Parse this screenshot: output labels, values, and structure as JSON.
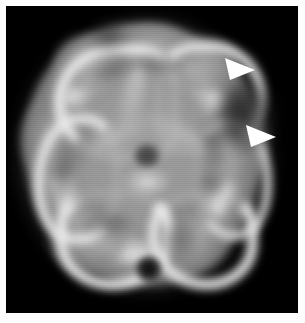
{
  "figure": {
    "title": "Transaxial brain perfusion scan",
    "modality_label": "",
    "frame_color": "#fdfdfd",
    "background_color": "#000000",
    "width_px": 305,
    "height_px": 323
  },
  "scan": {
    "type": "grayscale-tomographic-slice",
    "orientation": "transaxial",
    "colormap": "grayscale",
    "intensity_low_color": "#000000",
    "intensity_mid_color": "#8e8e8e",
    "intensity_high_color": "#e8e8e8",
    "regions": [
      {
        "name": "cortical-ribbon",
        "intensity": "high",
        "description": "bright gyral rim of tracer uptake"
      },
      {
        "name": "central-white-matter",
        "intensity": "mid",
        "description": "uniform mid-gray interior"
      },
      {
        "name": "central-focal-defect",
        "intensity": "low",
        "description": "dark round focus at slice center"
      },
      {
        "name": "posterior-midline-defect",
        "intensity": "low",
        "description": "dark round focus at inferior midline"
      },
      {
        "name": "right-lateral-hypoperfusion",
        "intensity": "reduced",
        "description": "region indicated by arrowheads"
      }
    ]
  },
  "annotations": {
    "marker_color": "#ffffff",
    "items": [
      {
        "id": "arrowhead-upper",
        "icon": "arrowhead-icon",
        "label": "",
        "points_to": "right-lateral-hypoperfusion",
        "x": 231,
        "y": 60
      },
      {
        "id": "arrowhead-lower",
        "icon": "arrowhead-icon",
        "label": "",
        "points_to": "right-lateral-hypoperfusion",
        "x": 252,
        "y": 127
      }
    ]
  }
}
